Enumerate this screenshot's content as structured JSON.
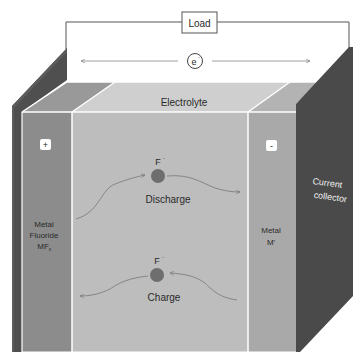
{
  "diagram": {
    "load": {
      "label": "Load"
    },
    "electron": {
      "label": "e",
      "superscript": "-"
    },
    "electrolyte": {
      "label": "Electrolyte"
    },
    "cathode": {
      "sign": "+",
      "line1": "Metal",
      "line2": "Fluoride",
      "line3": "MF",
      "line3_sub": "x"
    },
    "anode": {
      "sign": "-",
      "line1": "Metal",
      "line2": "M'"
    },
    "collector": {
      "line1": "Current",
      "line2": "collector"
    },
    "discharge": {
      "ion": "F",
      "ion_charge": "-",
      "label": "Discharge"
    },
    "charge": {
      "ion": "F",
      "ion_charge": "-",
      "label": "Charge"
    },
    "colors": {
      "collector": "#4d4d4d",
      "cathode_front": "#8c8c8c",
      "cathode_top": "#9a9a9a",
      "electrolyte_front": "#bdbdbd",
      "electrolyte_top": "#cfcfcf",
      "anode_front": "#a9a9a9",
      "anode_top": "#b5b5b5",
      "ion": "#6e6e6e",
      "wire": "#555555"
    }
  }
}
